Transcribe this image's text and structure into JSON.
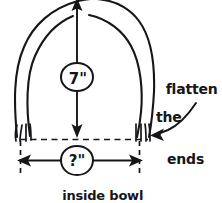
{
  "diagram": {
    "title_visible": false,
    "background_color": "#ffffff",
    "ink_color": "#16161a",
    "style": "hand-drawn pencil sketch",
    "dimensions": {
      "height": {
        "value": "7\"",
        "icon": "circled-dimension-bubble",
        "orientation": "vertical",
        "arrow": "double-headed-vertical"
      },
      "width": {
        "value": "?\"",
        "icon": "circled-dimension-bubble",
        "orientation": "horizontal",
        "arrow": "double-headed-horizontal"
      }
    },
    "annotations": {
      "flatten": {
        "line1": "flatten",
        "line2": "the",
        "line3": "ends",
        "pointer": "curved-arrow-left"
      },
      "caption": {
        "line1": "inside bowl",
        "line2": "measurement"
      }
    },
    "guides": {
      "baseline": "horizontal-dashed",
      "left_extension": "vertical-dashed",
      "right_extension": "vertical-dashed"
    }
  }
}
